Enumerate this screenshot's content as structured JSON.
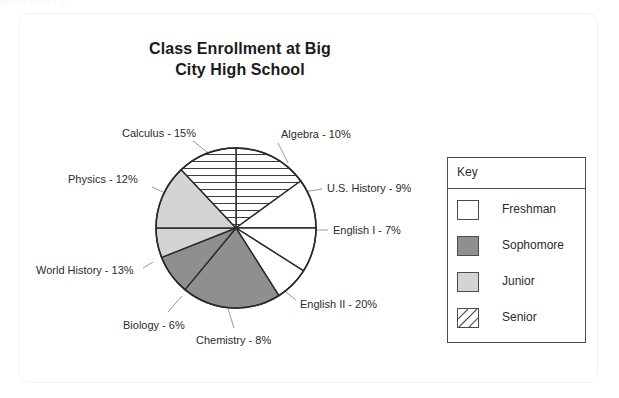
{
  "card": {
    "top_sliver_text": "jjjj jjjj jj jjjj j jj j"
  },
  "chart_data": {
    "type": "pie",
    "title": "Class Enrollment at Big City High School",
    "title_lines": [
      "Class Enrollment at Big",
      "City High School"
    ],
    "unit": "%",
    "start_angle_deg": 270,
    "direction": "clockwise",
    "categories": [
      "Calculus",
      "Algebra",
      "U.S. History",
      "English I",
      "English II",
      "Chemistry",
      "Biology",
      "World History",
      "Physics"
    ],
    "values": [
      15,
      10,
      9,
      7,
      20,
      8,
      6,
      13,
      12
    ],
    "slices": [
      {
        "label": "Calculus - 15%",
        "name": "Calculus",
        "value": 15,
        "group": "Senior",
        "fill": "#ffffff",
        "pattern": "horizontal-hatch"
      },
      {
        "label": "Algebra - 10%",
        "name": "Algebra",
        "value": 10,
        "group": "Freshman",
        "fill": "#ffffff",
        "pattern": "none"
      },
      {
        "label": "U.S. History - 9%",
        "name": "U.S. History",
        "value": 9,
        "group": "Freshman",
        "fill": "#ffffff",
        "pattern": "none"
      },
      {
        "label": "English I - 7%",
        "name": "English I",
        "value": 7,
        "group": "Freshman",
        "fill": "#ffffff",
        "pattern": "none"
      },
      {
        "label": "English II - 20%",
        "name": "English II",
        "value": 20,
        "group": "Sophomore",
        "fill": "#8f8f8f",
        "pattern": "none"
      },
      {
        "label": "Chemistry - 8%",
        "name": "Chemistry",
        "value": 8,
        "group": "Sophomore",
        "fill": "#8f8f8f",
        "pattern": "none"
      },
      {
        "label": "Biology - 6%",
        "name": "Biology",
        "value": 6,
        "group": "Junior",
        "fill": "#d4d4d4",
        "pattern": "none"
      },
      {
        "label": "World History - 13%",
        "name": "World History",
        "value": 13,
        "group": "Junior",
        "fill": "#d4d4d4",
        "pattern": "none"
      },
      {
        "label": "Physics - 12%",
        "name": "Physics",
        "value": 12,
        "group": "Senior",
        "fill": "#ffffff",
        "pattern": "horizontal-hatch"
      }
    ],
    "geometry": {
      "cx": 236,
      "cy": 228,
      "r": 80
    },
    "labels": [
      {
        "text": "Calculus - 15%",
        "x": 122,
        "y": 127,
        "leader": [
          193,
          141,
          211,
          155
        ]
      },
      {
        "text": "Physics - 12%",
        "x": 68,
        "y": 173,
        "leader": [
          152,
          187,
          178,
          199
        ]
      },
      {
        "text": "Algebra - 10%",
        "x": 281,
        "y": 128,
        "leader": [
          278,
          143,
          288,
          163
        ]
      },
      {
        "text": "U.S. History - 9%",
        "x": 327,
        "y": 182,
        "leader": [
          303,
          192,
          322,
          189
        ]
      },
      {
        "text": "English I - 7%",
        "x": 333,
        "y": 224,
        "leader": [
          310,
          230,
          328,
          230
        ]
      },
      {
        "text": "English II - 20%",
        "x": 300,
        "y": 298,
        "leader": [
          281,
          288,
          296,
          300
        ]
      },
      {
        "text": "Chemistry - 8%",
        "x": 196,
        "y": 334,
        "leader": [
          228,
          309,
          234,
          328
        ]
      },
      {
        "text": "Biology - 6%",
        "x": 123,
        "y": 319,
        "leader": [
          182,
          296,
          168,
          312
        ]
      },
      {
        "text": "World History - 13%",
        "x": 36,
        "y": 264,
        "leader": [
          153,
          262,
          143,
          268
        ]
      }
    ],
    "legend": {
      "title": "Key",
      "position": "right",
      "items": [
        {
          "label": "Freshman",
          "fill": "#ffffff",
          "pattern": "none"
        },
        {
          "label": "Sophomore",
          "fill": "#8f8f8f",
          "pattern": "none"
        },
        {
          "label": "Junior",
          "fill": "#d4d4d4",
          "pattern": "none"
        },
        {
          "label": "Senior",
          "fill": "#ffffff",
          "pattern": "diagonal-hatch"
        }
      ]
    }
  }
}
